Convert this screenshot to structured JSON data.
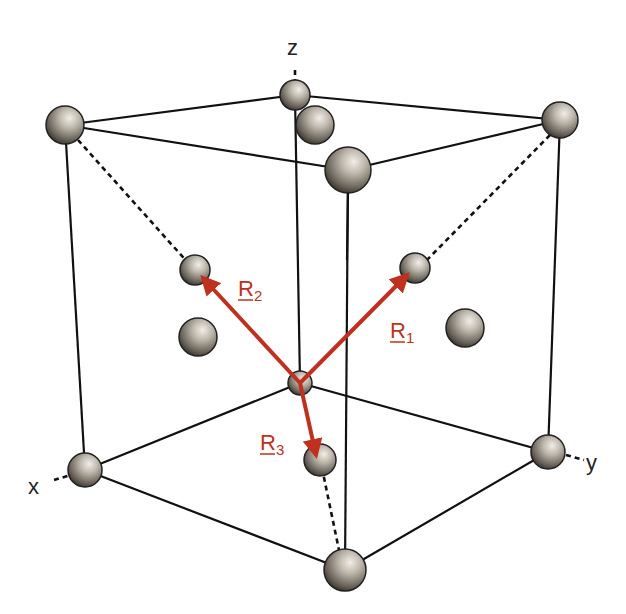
{
  "diagram": {
    "axes": {
      "x": "x",
      "y": "y",
      "z": "z"
    },
    "vectors": [
      {
        "id": "R1",
        "letter": "R",
        "subscript": "1",
        "color": "#c0301e"
      },
      {
        "id": "R2",
        "letter": "R",
        "subscript": "2",
        "color": "#c0301e"
      },
      {
        "id": "R3",
        "letter": "R",
        "subscript": "3",
        "color": "#c0301e"
      }
    ],
    "colors": {
      "edge": "#111111",
      "vector": "#c0301e",
      "atom_light": "#e9e6e0",
      "atom_dark": "#3a3631"
    }
  }
}
